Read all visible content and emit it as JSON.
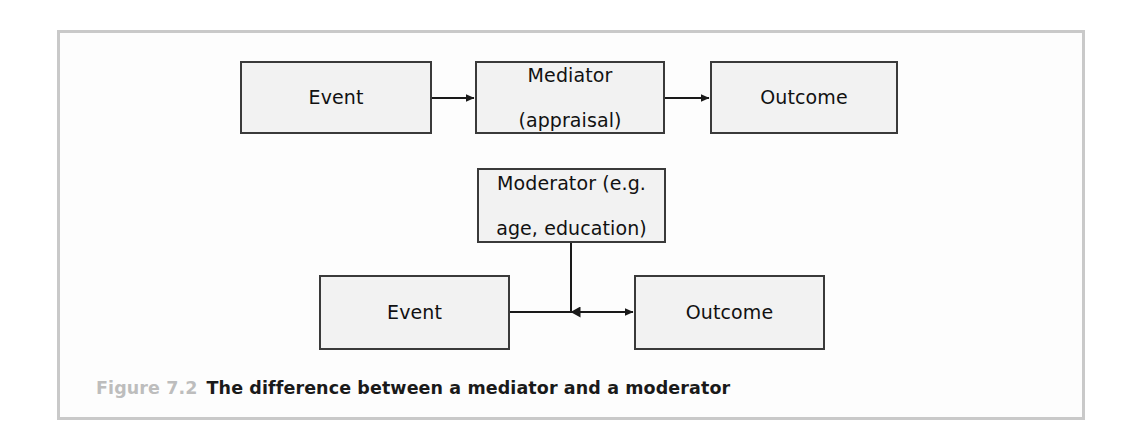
{
  "figure": {
    "caption_label": "Figure 7.2",
    "caption_text": "The difference between a mediator and a moderator",
    "frame_border_color": "#c9c9c9",
    "background_color": "#ffffff"
  },
  "diagram": {
    "type": "flow-diagram",
    "node_fill_color": "#f2f2f2",
    "node_border_color": "#3a3a3a",
    "connector_color": "#1a1a1a",
    "rows": [
      {
        "name": "mediation-row",
        "nodes": [
          {
            "id": "event-top",
            "label": "Event"
          },
          {
            "id": "mediator",
            "label": "Mediator\n(appraisal)",
            "line1": "Mediator",
            "line2": "(appraisal)"
          },
          {
            "id": "outcome-top",
            "label": "Outcome"
          }
        ],
        "arrows": [
          {
            "from": "event-top",
            "to": "mediator",
            "direction": "right"
          },
          {
            "from": "mediator",
            "to": "outcome-top",
            "direction": "right"
          }
        ]
      },
      {
        "name": "moderation-row",
        "nodes": [
          {
            "id": "moderator",
            "label": "Moderator (e.g.\nage, education)",
            "line1": "Moderator (e.g.",
            "line2": "age, education)"
          },
          {
            "id": "event-bottom",
            "label": "Event"
          },
          {
            "id": "outcome-bottom",
            "label": "Outcome"
          }
        ],
        "arrows": [
          {
            "from": "event-bottom",
            "to": "outcome-bottom",
            "direction": "right"
          },
          {
            "from": "moderator",
            "to": "event-outcome-path",
            "direction": "down"
          }
        ]
      }
    ]
  }
}
